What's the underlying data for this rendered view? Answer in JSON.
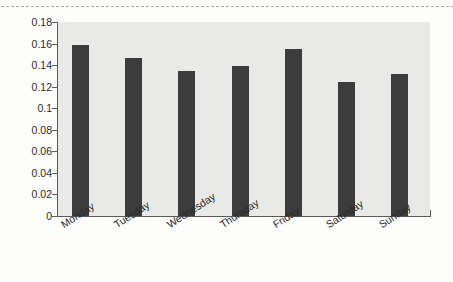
{
  "figure": {
    "background_color": "#fdfdfc",
    "plot_background_color": "#e9e9e7",
    "bar_color": "#3c3c3c",
    "axis_color": "#5a5a5a",
    "perforation_label": "dotted-edge-line"
  },
  "chart_data": {
    "type": "bar",
    "title": "",
    "xlabel": "",
    "ylabel": "",
    "categories": [
      "Monday",
      "Tuesday",
      "Wednesday",
      "Thursday",
      "Friday",
      "Saturday",
      "Sunday"
    ],
    "values": [
      0.159,
      0.147,
      0.135,
      0.139,
      0.155,
      0.124,
      0.132
    ],
    "ylim": [
      0,
      0.18
    ],
    "ytick_values": [
      0,
      0.02,
      0.04,
      0.06,
      0.08,
      0.1,
      0.12,
      0.14,
      0.16,
      0.18
    ],
    "ytick_labels": [
      "0",
      "0.02",
      "0.04",
      "0.06",
      "0.08",
      "0.1",
      "0.12",
      "0.14",
      "0.16",
      "0.18"
    ],
    "grid": false,
    "legend": null,
    "xtick_label_rotation_deg": 33,
    "bar_color": "#3c3c3c",
    "series": [
      {
        "name": "value",
        "values": [
          0.159,
          0.147,
          0.135,
          0.139,
          0.155,
          0.124,
          0.132
        ]
      }
    ]
  }
}
